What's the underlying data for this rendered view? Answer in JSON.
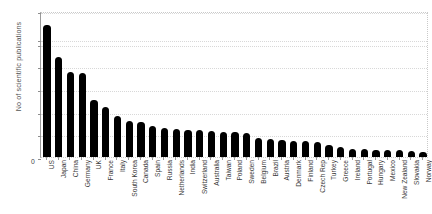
{
  "chart_data": {
    "type": "bar",
    "title": "",
    "xlabel": "",
    "ylabel": "No of scientific publications",
    "orientation": "vertical",
    "grid": true,
    "legend": null,
    "bar_color": "#000000",
    "axis_break": {
      "present": true,
      "between": [
        10000,
        18000
      ],
      "note": "y-axis is broken: ticks run 0-10,000 in 2000 steps, then jump to 18,000 and 20,000"
    },
    "ylim": [
      0,
      20000
    ],
    "ytick_labels": [
      "0",
      "2000",
      "4000",
      "6000",
      "8000",
      "10,000",
      "18,000",
      "20,000"
    ],
    "ytick_values": [
      0,
      2000,
      4000,
      6000,
      8000,
      10000,
      18000,
      20000
    ],
    "categories": [
      "US",
      "Japan",
      "China",
      "Germany",
      "UK",
      "France",
      "Italy",
      "South Korea",
      "Canada",
      "Spain",
      "Russia",
      "Netherlands",
      "India",
      "Switzerland",
      "Australia",
      "Taiwan",
      "Poland",
      "Sweden",
      "Belgium",
      "Brazil",
      "Austria",
      "Denmark",
      "Finland",
      "Czech Rep",
      "Turkey",
      "Greece",
      "Ireland",
      "Portugal",
      "Hungary",
      "Mexico",
      "New Zealand",
      "Slovakia",
      "Norway"
    ],
    "values": [
      19000,
      8800,
      7500,
      7400,
      5000,
      4400,
      3600,
      3200,
      3100,
      2700,
      2600,
      2500,
      2400,
      2350,
      2300,
      2250,
      2200,
      2100,
      1700,
      1550,
      1500,
      1450,
      1400,
      1300,
      1100,
      900,
      700,
      680,
      650,
      620,
      580,
      520,
      420
    ]
  }
}
